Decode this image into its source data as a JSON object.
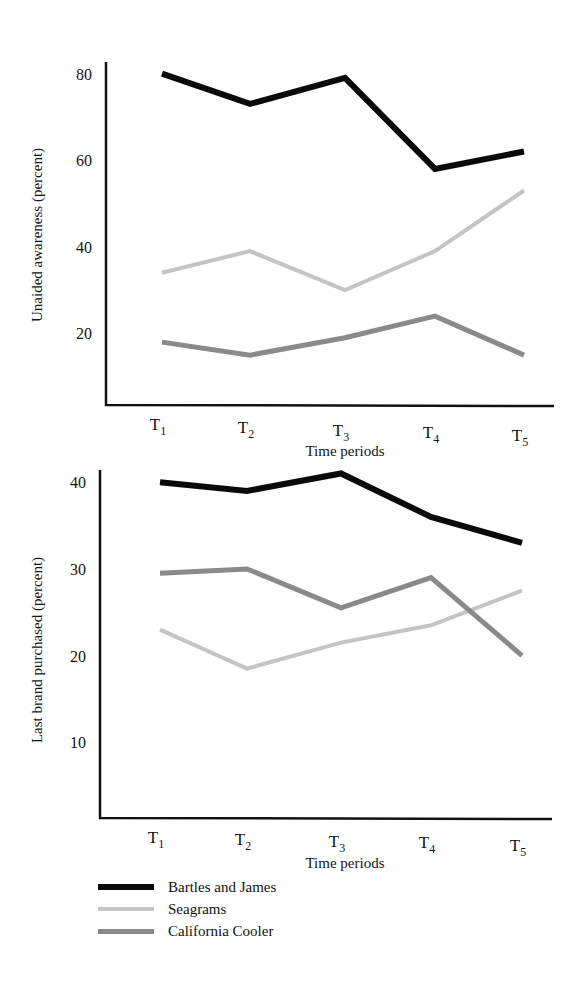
{
  "chart_data": [
    {
      "type": "line",
      "title": "",
      "xlabel": "Time periods",
      "ylabel": "Unaided awareness (percent)",
      "categories": [
        "T1",
        "T2",
        "T3",
        "T4",
        "T5"
      ],
      "yticks": [
        20,
        40,
        60,
        80
      ],
      "ylim": [
        0,
        83
      ],
      "grid": false,
      "series": [
        {
          "name": "Bartles and James",
          "values": [
            80,
            73,
            79,
            58,
            62
          ]
        },
        {
          "name": "Seagrams",
          "values": [
            34,
            39,
            30,
            39,
            53
          ]
        },
        {
          "name": "California Cooler",
          "values": [
            18,
            15,
            19,
            24,
            15
          ]
        }
      ]
    },
    {
      "type": "line",
      "title": "",
      "xlabel": "Time periods",
      "ylabel": "Last brand purchased (percent)",
      "categories": [
        "T1",
        "T2",
        "T3",
        "T4",
        "T5"
      ],
      "yticks": [
        10,
        20,
        30,
        40
      ],
      "ylim": [
        0,
        41
      ],
      "grid": false,
      "series": [
        {
          "name": "Bartles and James",
          "values": [
            40,
            39,
            41,
            36,
            33
          ]
        },
        {
          "name": "Seagrams",
          "values": [
            23,
            18.5,
            21.5,
            23.5,
            27.5
          ]
        },
        {
          "name": "California Cooler",
          "values": [
            29.5,
            30,
            25.5,
            29,
            20
          ]
        }
      ]
    }
  ],
  "legend": {
    "position": "bottom-left",
    "items": [
      {
        "label": "Bartles and James",
        "color": "#0a0a0a",
        "width": 6
      },
      {
        "label": "Seagrams",
        "color": "#c4c4c4",
        "width": 4
      },
      {
        "label": "California Cooler",
        "color": "#8a8a8a",
        "width": 5
      }
    ]
  },
  "styles": {
    "series_colors": [
      "#0a0a0a",
      "#c4c4c4",
      "#8a8a8a"
    ],
    "series_widths": [
      6,
      4,
      5
    ],
    "axis_color": "#111111"
  }
}
